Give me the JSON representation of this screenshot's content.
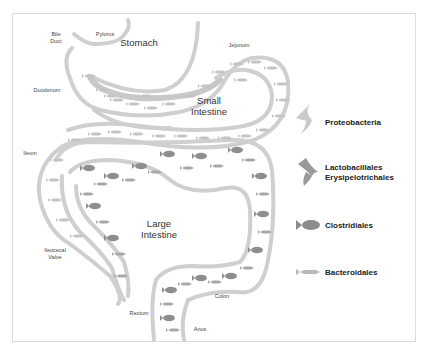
{
  "diagram": {
    "organs": {
      "stomach": "Stomach",
      "small_intestine": [
        "Small",
        "Intestine"
      ],
      "large_intestine": [
        "Large",
        "Intestine"
      ]
    },
    "labels": {
      "bile_duct": [
        "Bile",
        "Duct"
      ],
      "pylorus": "Pylorus",
      "jejunum": "Jejunum",
      "duodenum": "Duodenum",
      "ileum": "Ileum",
      "ileocecal_valve": [
        "Ileocecal",
        "Valve"
      ],
      "rectum": "Rectum",
      "anus": "Anus",
      "colon": "Colon"
    },
    "legend": [
      {
        "icon": "bird-icon",
        "label": "Proteobacteria",
        "color": "#c8c8c8"
      },
      {
        "icon": "hawk-icon",
        "label": [
          "Lactobacillales",
          "Erysipelotrichales"
        ],
        "color": "#9a9a9a"
      },
      {
        "icon": "fish-icon",
        "label": "Clostridiales",
        "color": "#8c8c8c"
      },
      {
        "icon": "small-fish-icon",
        "label": "Bacteroidales",
        "color": "#b8b8b8"
      }
    ],
    "colors": {
      "wall": "#cfcfcf",
      "frame": "#dcdcdc",
      "text": "#333333"
    }
  }
}
